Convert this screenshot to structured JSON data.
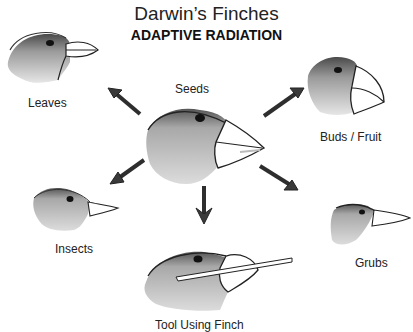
{
  "header": {
    "title": "Darwin’s Finches",
    "subtitle": "ADAPTIVE RADIATION"
  },
  "center": {
    "label": "Seeds"
  },
  "finches": [
    {
      "label": "Leaves",
      "diet": "leaves"
    },
    {
      "label": "Buds / Fruit",
      "diet": "buds-fruit"
    },
    {
      "label": "Insects",
      "diet": "insects"
    },
    {
      "label": "Grubs",
      "diet": "grubs"
    },
    {
      "label": "Tool Using Finch",
      "diet": "tool-using"
    }
  ],
  "colors": {
    "head_dark": "#555555",
    "head_light": "#d8d8d8",
    "beak": "#ffffff",
    "outline": "#222222",
    "arrow": "#3a3a3a"
  }
}
